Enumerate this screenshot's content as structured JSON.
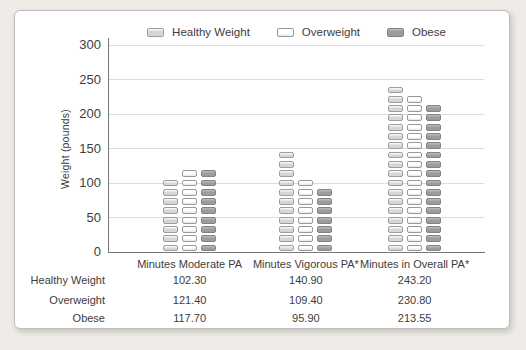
{
  "window": {
    "background": "#efece7",
    "card_background": "#ffffff",
    "card_border": "#bcbcbc"
  },
  "chart_data": {
    "type": "bar",
    "title": "",
    "ylabel": "Weight (pounds)",
    "xlabel": "",
    "ylim": [
      0,
      300
    ],
    "ytick_step": 50,
    "grid": true,
    "legend_position": "top",
    "bar_style": "stacked-segment-pills",
    "categories": [
      "Minutes Moderate PA",
      "Minutes Vigorous PA*",
      "Minutes in Overall PA*"
    ],
    "series": [
      {
        "name": "Healthy Weight",
        "values": [
          102.3,
          140.9,
          243.2
        ],
        "color": "#d6d6d6",
        "border": "#9e9e9e"
      },
      {
        "name": "Overweight",
        "values": [
          121.4,
          109.4,
          230.8
        ],
        "color": "#ffffff",
        "border": "#999999"
      },
      {
        "name": "Obese",
        "values": [
          117.7,
          95.9,
          213.55
        ],
        "color": "#9c9c9c",
        "border": "#838383"
      }
    ],
    "axis_color": "#787878",
    "gridline_color": "#dcdcdc",
    "text_color": "#3d3d3d"
  },
  "data_table": {
    "rows": [
      {
        "label": "Healthy Weight",
        "values": [
          "102.30",
          "140.90",
          "243.20"
        ]
      },
      {
        "label": "Overweight",
        "values": [
          "121.40",
          "109.40",
          "230.80"
        ]
      },
      {
        "label": "Obese",
        "values": [
          "117.70",
          "95.90",
          "213.55"
        ]
      }
    ]
  }
}
